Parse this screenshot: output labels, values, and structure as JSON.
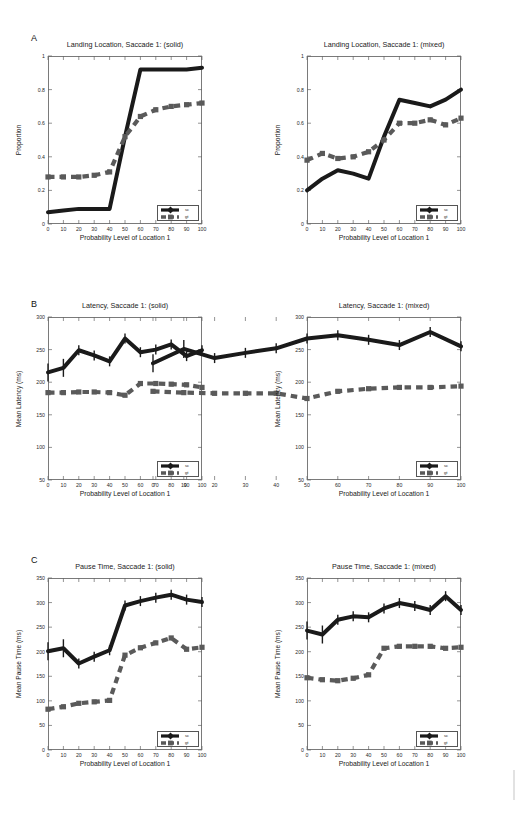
{
  "figure": {
    "panels": [
      {
        "letter": "A"
      },
      {
        "letter": "B"
      },
      {
        "letter": "C"
      }
    ]
  },
  "legend": {
    "series_sc": "sc",
    "series_gt": "gt",
    "sc_color": "#1a1a1a",
    "gt_color": "#5a5a5a"
  },
  "axis": {
    "xlabel": "Probability Level of Location 1",
    "xticks": [
      "0",
      "10",
      "20",
      "30",
      "40",
      "50",
      "60",
      "70",
      "80",
      "90",
      "100"
    ],
    "proportion_ylabel": "Proportion",
    "proportion_yticks": [
      "0",
      "0.2",
      "0.4",
      "0.6",
      "0.8",
      "1"
    ],
    "latency_ylabel": "Mean Latency (ms)",
    "latency_yticks": [
      "50",
      "100",
      "150",
      "200",
      "250",
      "300"
    ],
    "pause_ylabel": "Mean Pause Time (ms)",
    "pause_yticks": [
      "0",
      "50",
      "100",
      "150",
      "200",
      "250",
      "300",
      "350"
    ]
  },
  "chart_data": [
    {
      "id": "A-left",
      "type": "line",
      "title": "Landing Location,  Saccade 1: (solid)",
      "xlabel": "Probability Level of Location 1",
      "ylabel": "Proportion",
      "x": [
        0,
        10,
        20,
        30,
        40,
        50,
        60,
        70,
        80,
        90,
        100
      ],
      "xlim": [
        0,
        100
      ],
      "ylim": [
        0,
        1
      ],
      "grid": false,
      "legend_position": "lower-right",
      "series": [
        {
          "name": "sc",
          "style": "solid",
          "color": "#1a1a1a",
          "marker": "diamond",
          "values": [
            0.07,
            0.08,
            0.09,
            0.09,
            0.09,
            0.52,
            0.92,
            0.92,
            0.92,
            0.92,
            0.93
          ]
        },
        {
          "name": "gt",
          "style": "dashed",
          "color": "#5a5a5a",
          "marker": "square",
          "values": [
            0.28,
            0.28,
            0.28,
            0.29,
            0.31,
            0.52,
            0.64,
            0.68,
            0.7,
            0.71,
            0.72
          ]
        }
      ]
    },
    {
      "id": "A-right",
      "type": "line",
      "title": "Landing Location, Saccade 1: (mixed)",
      "xlabel": "Probability Level of Location 1",
      "ylabel": "Proportion",
      "x": [
        0,
        10,
        20,
        30,
        40,
        50,
        60,
        70,
        80,
        90,
        100
      ],
      "xlim": [
        0,
        100
      ],
      "ylim": [
        0,
        1
      ],
      "grid": false,
      "legend_position": "lower-right",
      "series": [
        {
          "name": "sc",
          "style": "solid",
          "color": "#1a1a1a",
          "marker": "diamond",
          "values": [
            0.2,
            0.27,
            0.32,
            0.3,
            0.27,
            0.52,
            0.74,
            0.72,
            0.7,
            0.74,
            0.8
          ]
        },
        {
          "name": "gt",
          "style": "dashed",
          "color": "#5a5a5a",
          "marker": "square",
          "values": [
            0.38,
            0.42,
            0.39,
            0.4,
            0.43,
            0.5,
            0.6,
            0.6,
            0.62,
            0.59,
            0.63
          ]
        }
      ]
    },
    {
      "id": "B-left",
      "type": "line",
      "title": "Latency, Saccade 1: (solid)",
      "xlabel": "Probability Level of Location 1",
      "ylabel": "Mean Latency (ms)",
      "x": [
        0,
        10,
        20,
        30,
        40,
        50,
        60,
        70,
        80,
        90,
        100
      ],
      "xlim": [
        0,
        100
      ],
      "ylim": [
        50,
        300
      ],
      "grid": false,
      "legend_position": "lower-right",
      "series": [
        {
          "name": "sc",
          "style": "solid",
          "color": "#1a1a1a",
          "marker": "diamond",
          "errorbars": true,
          "values": [
            215,
            222,
            249,
            241,
            232,
            267,
            246,
            250,
            258,
            240,
            249
          ]
        },
        {
          "name": "gt",
          "style": "dashed",
          "color": "#5a5a5a",
          "marker": "square",
          "values": [
            184,
            184,
            185,
            185,
            184,
            180,
            198,
            198,
            197,
            196,
            192
          ]
        }
      ]
    },
    {
      "id": "B-right",
      "type": "line",
      "title": "Latency, Saccade 1: (mixed)",
      "xlabel": "Probability Level of Location 1",
      "ylabel": "Mean Latency (ms)",
      "x": [
        0,
        10,
        20,
        30,
        40,
        50,
        60,
        70,
        80,
        90,
        100
      ],
      "xlim": [
        50,
        300
      ],
      "ylim": [
        50,
        300
      ],
      "grid": false,
      "legend_position": "lower-right",
      "series": [
        {
          "name": "sc",
          "style": "solid",
          "color": "#1a1a1a",
          "marker": "diamond",
          "errorbars": true,
          "values": [
            229,
            251,
            237,
            245,
            252,
            267,
            272,
            265,
            257,
            277,
            255
          ]
        },
        {
          "name": "gt",
          "style": "dashed",
          "color": "#5a5a5a",
          "marker": "square",
          "values": [
            186,
            184,
            183,
            183,
            183,
            175,
            186,
            190,
            192,
            192,
            194
          ]
        }
      ]
    },
    {
      "id": "C-left",
      "type": "line",
      "title": "Pause Time, Saccade 1: (solid)",
      "xlabel": "Probability Level of Location 1",
      "ylabel": "Mean Pause Time (ms)",
      "x": [
        0,
        10,
        20,
        30,
        40,
        50,
        60,
        70,
        80,
        90,
        100
      ],
      "xlim": [
        0,
        100
      ],
      "ylim": [
        0,
        350
      ],
      "grid": false,
      "legend_position": "lower-right",
      "series": [
        {
          "name": "sc",
          "style": "solid",
          "color": "#1a1a1a",
          "marker": "diamond",
          "errorbars": true,
          "values": [
            201,
            207,
            176,
            190,
            203,
            294,
            303,
            310,
            316,
            306,
            301
          ]
        },
        {
          "name": "gt",
          "style": "dashed",
          "color": "#5a5a5a",
          "marker": "square",
          "values": [
            83,
            88,
            95,
            98,
            101,
            193,
            208,
            218,
            228,
            205,
            209
          ]
        }
      ]
    },
    {
      "id": "C-right",
      "type": "line",
      "title": "Pause Time, Saccade 1: (mixed)",
      "xlabel": "Probability Level of Location 1",
      "ylabel": "Mean Pause Time (ms)",
      "x": [
        0,
        10,
        20,
        30,
        40,
        50,
        60,
        70,
        80,
        90,
        100
      ],
      "xlim": [
        0,
        100
      ],
      "ylim": [
        0,
        350
      ],
      "grid": false,
      "legend_position": "lower-right",
      "series": [
        {
          "name": "sc",
          "style": "solid",
          "color": "#1a1a1a",
          "marker": "diamond",
          "errorbars": true,
          "values": [
            243,
            235,
            265,
            272,
            270,
            288,
            299,
            293,
            285,
            313,
            285
          ]
        },
        {
          "name": "gt",
          "style": "dashed",
          "color": "#5a5a5a",
          "marker": "square",
          "values": [
            147,
            143,
            141,
            146,
            153,
            207,
            211,
            211,
            211,
            207,
            209
          ]
        }
      ]
    }
  ]
}
